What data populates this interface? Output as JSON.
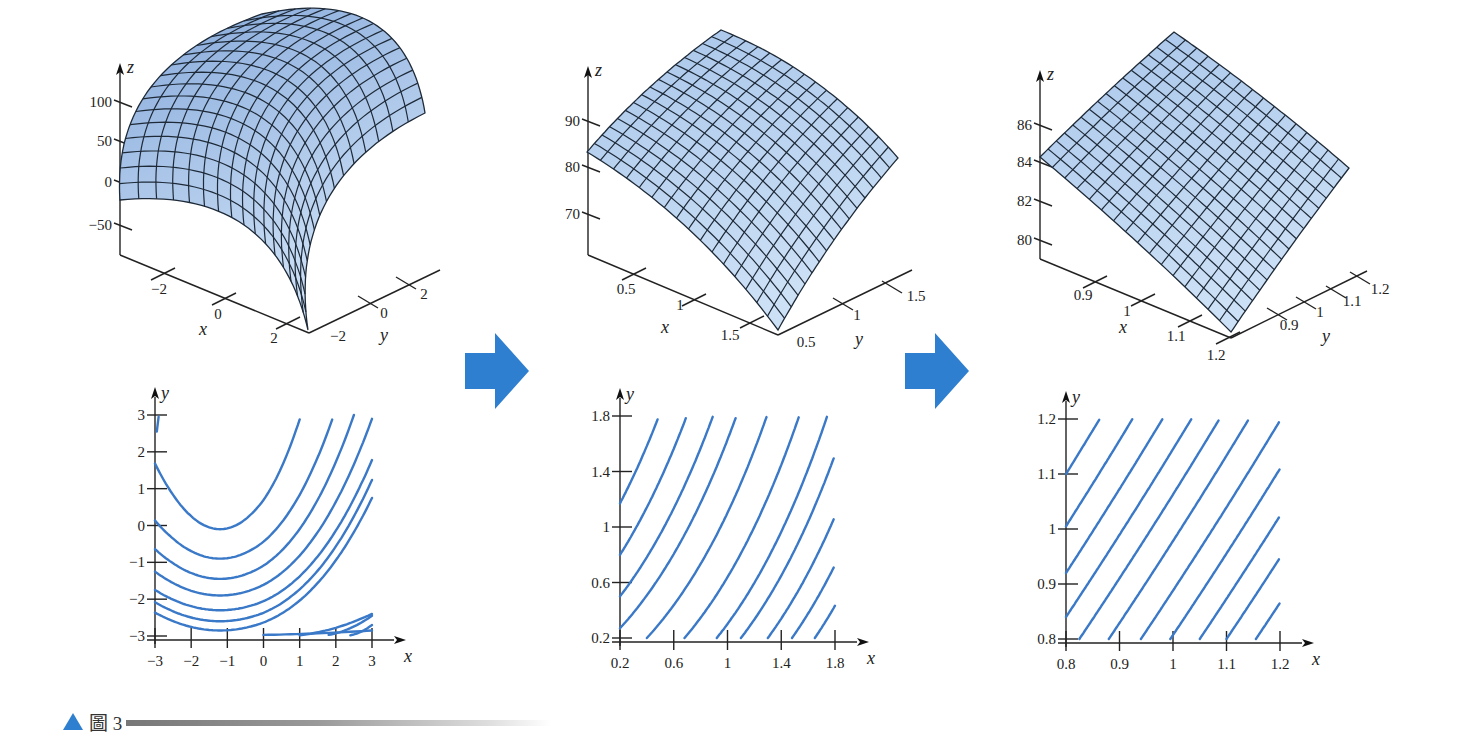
{
  "figure": {
    "caption": {
      "marker": "▲",
      "label": "圖 3"
    },
    "arrow_color": "#2f7fd0",
    "surface_fill_top": "#8fb2e0",
    "surface_fill_bottom": "#c9def5",
    "mesh_color": "#1e2a38",
    "contour_color": "#3a78c8",
    "arrows": [
      {
        "name": "zoom-arrow-1",
        "x": 465,
        "y": 333
      },
      {
        "name": "zoom-arrow-2",
        "x": 905,
        "y": 333
      }
    ]
  },
  "chart_data": [
    {
      "type": "surface3d",
      "title": "",
      "xlabel": "x",
      "ylabel": "y",
      "zlabel": "z",
      "x_range": [
        -3,
        3
      ],
      "y_range": [
        -3,
        3
      ],
      "z_ticks": [
        "100",
        "50",
        "0",
        "−50"
      ],
      "x_ticks": [
        "−2",
        "0",
        "2"
      ],
      "y_ticks": [
        "−2",
        "0",
        "2"
      ],
      "mesh_lines": 16,
      "description": "Concave-down surface, maximum ~110 near the back corner, descending toward front corner"
    },
    {
      "type": "surface3d",
      "xlabel": "x",
      "ylabel": "y",
      "zlabel": "z",
      "x_range": [
        0.2,
        1.8
      ],
      "y_range": [
        0.2,
        1.8
      ],
      "z_ticks": [
        "90",
        "80",
        "70"
      ],
      "x_ticks": [
        "0.5",
        "1",
        "1.5"
      ],
      "y_ticks": [
        "0.5",
        "1",
        "1.5"
      ],
      "mesh_lines": 16,
      "description": "Zoomed-in patch of the same surface, gently curved"
    },
    {
      "type": "surface3d",
      "xlabel": "x",
      "ylabel": "y",
      "zlabel": "z",
      "x_range": [
        0.8,
        1.2
      ],
      "y_range": [
        0.8,
        1.2
      ],
      "z_ticks": [
        "86",
        "84",
        "82",
        "80"
      ],
      "x_ticks": [
        "0.9",
        "1",
        "1.1",
        "1.2"
      ],
      "y_ticks": [
        "0.9",
        "1",
        "1.1",
        "1.2"
      ],
      "mesh_lines": 16,
      "description": "Further zoom; surface appears nearly planar"
    },
    {
      "type": "contour",
      "xlabel": "x",
      "ylabel": "y",
      "x_ticks": [
        "−3",
        "−2",
        "−1",
        "0",
        "1",
        "2",
        "3"
      ],
      "y_ticks": [
        "3",
        "2",
        "1",
        "0",
        "−1",
        "−2",
        "−3"
      ],
      "xlim": [
        -3,
        3
      ],
      "ylim": [
        -3,
        3
      ],
      "level_count": 11,
      "description": "U-shaped level curves, minimum near x=−1, opening upward and to the right"
    },
    {
      "type": "contour",
      "xlabel": "x",
      "ylabel": "y",
      "x_ticks": [
        "0.2",
        "0.6",
        "1",
        "1.4",
        "1.8"
      ],
      "y_ticks": [
        "1.8",
        "1.4",
        "1",
        "0.6",
        "0.2"
      ],
      "xlim": [
        0.2,
        1.8
      ],
      "ylim": [
        0.2,
        1.8
      ],
      "level_count": 12,
      "description": "Gently curved, nearly parallel diagonal level curves"
    },
    {
      "type": "contour",
      "xlabel": "x",
      "ylabel": "y",
      "x_ticks": [
        "0.8",
        "0.9",
        "1",
        "1.1",
        "1.2"
      ],
      "y_ticks": [
        "1.2",
        "1.1",
        "1",
        "0.9",
        "0.8"
      ],
      "xlim": [
        0.8,
        1.2
      ],
      "ylim": [
        0.8,
        1.2
      ],
      "level_count": 12,
      "description": "Almost straight, evenly spaced parallel level lines (locally linear)"
    }
  ]
}
